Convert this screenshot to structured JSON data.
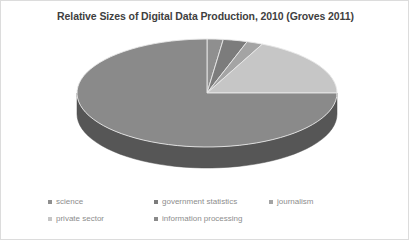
{
  "chart_data": {
    "type": "pie",
    "title": "Relative Sizes of Digital Data Production, 2010 (Groves 2011)",
    "xlabel": "",
    "ylabel": "",
    "legend_position": "bottom",
    "grid": false,
    "three_d": true,
    "categories": [
      "science",
      "government statistics",
      "journalism",
      "private sector",
      "information processing"
    ],
    "values": [
      2,
      3,
      2,
      18,
      75
    ],
    "colors": [
      "#8f8f8f",
      "#7c7c7c",
      "#a4a4a4",
      "#c6c6c6",
      "#8a8a8a"
    ],
    "slices": [
      {
        "label": "science",
        "value": 2,
        "color": "#8f8f8f",
        "start_angle": 0,
        "end_angle": 7.2
      },
      {
        "label": "government statistics",
        "value": 3,
        "color": "#7c7c7c",
        "start_angle": 7.2,
        "end_angle": 18.0
      },
      {
        "label": "journalism",
        "value": 2,
        "color": "#a4a4a4",
        "start_angle": 18.0,
        "end_angle": 25.2
      },
      {
        "label": "private sector",
        "value": 18,
        "color": "#c6c6c6",
        "start_angle": 25.2,
        "end_angle": 90.0
      },
      {
        "label": "information processing",
        "value": 75,
        "color": "#8a8a8a",
        "start_angle": 90.0,
        "end_angle": 360.0
      }
    ]
  },
  "legend": {
    "rows": [
      [
        {
          "label": "science",
          "color": "#8f8f8f",
          "x": 47
        },
        {
          "label": "government statistics",
          "color": "#7c7c7c",
          "x": 153
        },
        {
          "label": "journalism",
          "color": "#a4a4a4",
          "x": 268
        }
      ],
      [
        {
          "label": "private sector",
          "color": "#c6c6c6",
          "x": 47
        },
        {
          "label": "information processing",
          "color": "#8a8a8a",
          "x": 153
        }
      ]
    ]
  },
  "style": {
    "background": "#ffffff",
    "border_color": "#dcdcdc",
    "title_color": "#3f3f3f",
    "legend_text_color": "#8d8d8d",
    "slice_edge_color": "#e8e8e8"
  }
}
